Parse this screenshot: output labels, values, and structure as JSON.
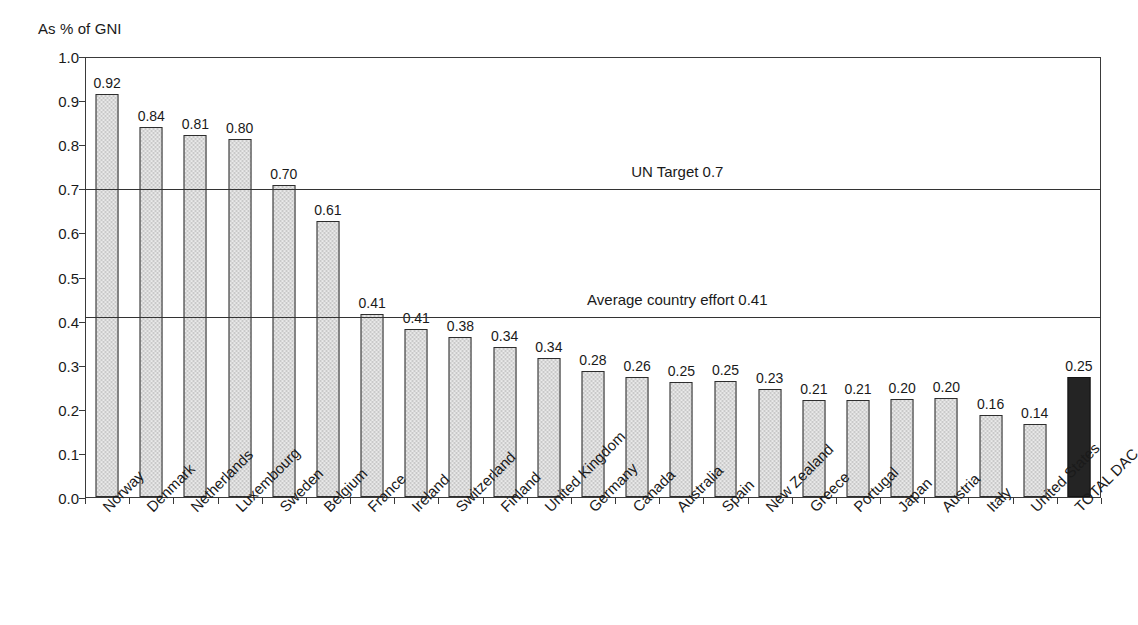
{
  "chart_data": {
    "type": "bar",
    "title": "",
    "subtitle": "",
    "xlabel": "",
    "ylabel": "As % of GNI",
    "ylim": [
      0.0,
      1.0
    ],
    "grid": true,
    "legend": "none",
    "categories": [
      "Norway",
      "Denmark",
      "Netherlands",
      "Luxembourg",
      "Sweden",
      "Belgium",
      "France",
      "Ireland",
      "Switzerland",
      "Finland",
      "United Kingdom",
      "Germany",
      "Canada",
      "Australia",
      "Spain",
      "New Zealand",
      "Greece",
      "Portugal",
      "Japan",
      "Austria",
      "Italy",
      "United States",
      "TOTAL DAC"
    ],
    "values": [
      0.92,
      0.84,
      0.81,
      0.8,
      0.7,
      0.61,
      0.41,
      0.41,
      0.38,
      0.34,
      0.34,
      0.28,
      0.26,
      0.25,
      0.25,
      0.23,
      0.21,
      0.21,
      0.2,
      0.2,
      0.16,
      0.14,
      0.25
    ],
    "value_labels": [
      "0.92",
      "0.84",
      "0.81",
      "0.80",
      "0.70",
      "0.61",
      "0.41",
      "0.41",
      "0.38",
      "0.34",
      "0.34",
      "0.28",
      "0.26",
      "0.25",
      "0.25",
      "0.23",
      "0.21",
      "0.21",
      "0.20",
      "0.20",
      "0.16",
      "0.14",
      "0.25"
    ],
    "bar_plot_heights": [
      0.915,
      0.838,
      0.82,
      0.811,
      0.707,
      0.625,
      0.415,
      0.38,
      0.363,
      0.34,
      0.316,
      0.285,
      0.273,
      0.261,
      0.262,
      0.245,
      0.219,
      0.221,
      0.223,
      0.224,
      0.186,
      0.166,
      0.273
    ],
    "highlight_index": 22,
    "yticks": [
      0.0,
      0.1,
      0.2,
      0.3,
      0.4,
      0.5,
      0.6,
      0.7,
      0.8,
      0.9,
      1.0
    ],
    "ytick_labels": [
      "0.0",
      "0.1",
      "0.2",
      "0.3",
      "0.4",
      "0.5",
      "0.6",
      "0.7",
      "0.8",
      "0.9",
      "1.0"
    ],
    "reference_lines": [
      {
        "label": "UN Target 0.7",
        "value": 0.7,
        "label_x_fraction": 0.583
      },
      {
        "label": "Average country effort 0.41",
        "value": 0.41,
        "label_x_fraction": 0.583
      }
    ],
    "colors": {
      "bar_fill": "#c9c9c9",
      "bar_border": "#2e2e2e",
      "highlight_fill": "#242424",
      "axis": "#3a3a3a",
      "gridline": "#555555",
      "text": "#1a1a1a",
      "background": "#ffffff"
    }
  }
}
